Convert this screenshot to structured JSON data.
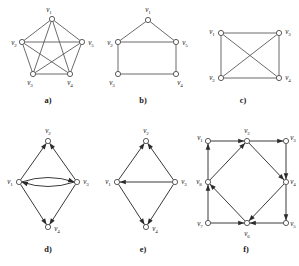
{
  "figure": {
    "background_color": "#ffffff",
    "edge_color": "#5a5a5a",
    "node_fill": "#ffffff",
    "node_stroke": "#4a4a4a",
    "label_color": "#1a1a1a",
    "width": 299,
    "height": 266
  },
  "panels": [
    {
      "id": "a",
      "caption": "a)",
      "caption_x": 48,
      "caption_y": 103,
      "kind": "undirected",
      "description": "complete graph K5 drawn as pentagon with all diagonals",
      "nodes": [
        {
          "name": "v1",
          "label": "v",
          "sub": "1",
          "x": 52,
          "y": 19,
          "lx": 49,
          "ly": 12,
          "anchor": "middle"
        },
        {
          "name": "v2",
          "label": "v",
          "sub": "2",
          "x": 22,
          "y": 42,
          "lx": 14,
          "ly": 45,
          "anchor": "middle"
        },
        {
          "name": "v5",
          "label": "v",
          "sub": "5",
          "x": 82,
          "y": 42,
          "lx": 91,
          "ly": 45,
          "anchor": "middle"
        },
        {
          "name": "v3",
          "label": "v",
          "sub": "3",
          "x": 33,
          "y": 74,
          "lx": 30,
          "ly": 85,
          "anchor": "middle"
        },
        {
          "name": "v4",
          "label": "v",
          "sub": "4",
          "x": 70,
          "y": 74,
          "lx": 70,
          "ly": 85,
          "anchor": "middle"
        }
      ],
      "edges": [
        {
          "from": "v1",
          "to": "v2"
        },
        {
          "from": "v1",
          "to": "v5"
        },
        {
          "from": "v1",
          "to": "v3"
        },
        {
          "from": "v1",
          "to": "v4"
        },
        {
          "from": "v2",
          "to": "v5"
        },
        {
          "from": "v2",
          "to": "v3"
        },
        {
          "from": "v2",
          "to": "v4"
        },
        {
          "from": "v5",
          "to": "v3"
        },
        {
          "from": "v5",
          "to": "v4"
        },
        {
          "from": "v3",
          "to": "v4"
        }
      ]
    },
    {
      "id": "b",
      "caption": "b)",
      "caption_x": 143,
      "caption_y": 103,
      "kind": "undirected",
      "description": "house graph: triangle roof over square",
      "nodes": [
        {
          "name": "v1",
          "label": "v",
          "sub": "1",
          "x": 148,
          "y": 20,
          "lx": 148,
          "ly": 12,
          "anchor": "middle"
        },
        {
          "name": "v2",
          "label": "v",
          "sub": "2",
          "x": 118,
          "y": 42,
          "lx": 110,
          "ly": 45,
          "anchor": "middle"
        },
        {
          "name": "v5",
          "label": "v",
          "sub": "5",
          "x": 176,
          "y": 42,
          "lx": 185,
          "ly": 45,
          "anchor": "middle"
        },
        {
          "name": "v3",
          "label": "v",
          "sub": "3",
          "x": 118,
          "y": 74,
          "lx": 112,
          "ly": 85,
          "anchor": "middle"
        },
        {
          "name": "v4",
          "label": "v",
          "sub": "4",
          "x": 176,
          "y": 74,
          "lx": 180,
          "ly": 85,
          "anchor": "middle"
        }
      ],
      "edges": [
        {
          "from": "v1",
          "to": "v2"
        },
        {
          "from": "v1",
          "to": "v5"
        },
        {
          "from": "v2",
          "to": "v5"
        },
        {
          "from": "v2",
          "to": "v3"
        },
        {
          "from": "v5",
          "to": "v4"
        },
        {
          "from": "v3",
          "to": "v4"
        }
      ]
    },
    {
      "id": "c",
      "caption": "c)",
      "caption_x": 243,
      "caption_y": 103,
      "kind": "undirected",
      "description": "complete graph K4 drawn as rectangle with both diagonals",
      "nodes": [
        {
          "name": "v1",
          "label": "v",
          "sub": "1",
          "x": 221,
          "y": 33,
          "lx": 212,
          "ly": 34,
          "anchor": "middle"
        },
        {
          "name": "v3",
          "label": "v",
          "sub": "3",
          "x": 279,
          "y": 33,
          "lx": 288,
          "ly": 34,
          "anchor": "middle"
        },
        {
          "name": "v2",
          "label": "v",
          "sub": "2",
          "x": 221,
          "y": 78,
          "lx": 212,
          "ly": 80,
          "anchor": "middle"
        },
        {
          "name": "v4",
          "label": "v",
          "sub": "4",
          "x": 279,
          "y": 78,
          "lx": 288,
          "ly": 80,
          "anchor": "middle"
        }
      ],
      "edges": [
        {
          "from": "v1",
          "to": "v3"
        },
        {
          "from": "v1",
          "to": "v2"
        },
        {
          "from": "v3",
          "to": "v4"
        },
        {
          "from": "v2",
          "to": "v4"
        },
        {
          "from": "v1",
          "to": "v4"
        },
        {
          "from": "v2",
          "to": "v3"
        }
      ]
    },
    {
      "id": "d",
      "caption": "d)",
      "caption_x": 48,
      "caption_y": 252,
      "kind": "directed-multigraph",
      "description": "diamond digraph with a pair of opposite curved arcs between v1 and v3",
      "nodes": [
        {
          "name": "v2",
          "label": "v",
          "sub": "2",
          "x": 48,
          "y": 141,
          "lx": 48,
          "ly": 133,
          "anchor": "middle"
        },
        {
          "name": "v1",
          "label": "v",
          "sub": "1",
          "x": 19,
          "y": 182,
          "lx": 10,
          "ly": 184,
          "anchor": "middle"
        },
        {
          "name": "v3",
          "label": "v",
          "sub": "3",
          "x": 77,
          "y": 182,
          "lx": 86,
          "ly": 184,
          "anchor": "middle"
        },
        {
          "name": "v4",
          "label": "v",
          "sub": "4",
          "x": 48,
          "y": 227,
          "lx": 57,
          "ly": 231,
          "anchor": "middle"
        }
      ],
      "edges": [
        {
          "from": "v1",
          "to": "v2",
          "directed": true
        },
        {
          "from": "v3",
          "to": "v2",
          "directed": true
        },
        {
          "from": "v1",
          "to": "v3",
          "directed": true,
          "curve": "up"
        },
        {
          "from": "v3",
          "to": "v1",
          "directed": true,
          "curve": "down"
        },
        {
          "from": "v1",
          "to": "v4",
          "directed": true
        },
        {
          "from": "v3",
          "to": "v4",
          "directed": true
        }
      ]
    },
    {
      "id": "e",
      "caption": "e)",
      "caption_x": 143,
      "caption_y": 252,
      "kind": "directed",
      "description": "diamond digraph with a single straight arc from v3 to v1",
      "nodes": [
        {
          "name": "v2",
          "label": "v",
          "sub": "2",
          "x": 146,
          "y": 141,
          "lx": 146,
          "ly": 133,
          "anchor": "middle"
        },
        {
          "name": "v1",
          "label": "v",
          "sub": "1",
          "x": 117,
          "y": 182,
          "lx": 108,
          "ly": 184,
          "anchor": "middle"
        },
        {
          "name": "v3",
          "label": "v",
          "sub": "3",
          "x": 175,
          "y": 182,
          "lx": 184,
          "ly": 184,
          "anchor": "middle"
        },
        {
          "name": "v4",
          "label": "v",
          "sub": "4",
          "x": 146,
          "y": 227,
          "lx": 155,
          "ly": 231,
          "anchor": "middle"
        }
      ],
      "edges": [
        {
          "from": "v1",
          "to": "v2",
          "directed": true
        },
        {
          "from": "v3",
          "to": "v2",
          "directed": true
        },
        {
          "from": "v3",
          "to": "v1",
          "directed": true
        },
        {
          "from": "v1",
          "to": "v4",
          "directed": true
        },
        {
          "from": "v3",
          "to": "v4",
          "directed": true
        }
      ]
    },
    {
      "id": "f",
      "caption": "f)",
      "caption_x": 246,
      "caption_y": 252,
      "kind": "directed",
      "description": "eight-vertex digraph: outer square with inscribed rotated square",
      "nodes": [
        {
          "name": "v1",
          "label": "v",
          "sub": "1",
          "x": 208,
          "y": 141,
          "lx": 200,
          "ly": 140,
          "anchor": "middle"
        },
        {
          "name": "v2",
          "label": "v",
          "sub": "2",
          "x": 247,
          "y": 141,
          "lx": 247,
          "ly": 133,
          "anchor": "middle"
        },
        {
          "name": "v3",
          "label": "v",
          "sub": "3",
          "x": 286,
          "y": 141,
          "lx": 293,
          "ly": 140,
          "anchor": "middle"
        },
        {
          "name": "v4",
          "label": "v",
          "sub": "4",
          "x": 286,
          "y": 182,
          "lx": 293,
          "ly": 184,
          "anchor": "middle"
        },
        {
          "name": "v5",
          "label": "v",
          "sub": "5",
          "x": 286,
          "y": 223,
          "lx": 293,
          "ly": 226,
          "anchor": "middle"
        },
        {
          "name": "v6",
          "label": "v",
          "sub": "6",
          "x": 247,
          "y": 223,
          "lx": 247,
          "ly": 236,
          "anchor": "middle"
        },
        {
          "name": "v7",
          "label": "v",
          "sub": "7",
          "x": 208,
          "y": 223,
          "lx": 200,
          "ly": 226,
          "anchor": "middle"
        },
        {
          "name": "v8",
          "label": "v",
          "sub": "8",
          "x": 208,
          "y": 182,
          "lx": 199,
          "ly": 184,
          "anchor": "middle"
        }
      ],
      "edges": [
        {
          "from": "v1",
          "to": "v2",
          "directed": true
        },
        {
          "from": "v2",
          "to": "v3",
          "directed": true
        },
        {
          "from": "v3",
          "to": "v4",
          "directed": true
        },
        {
          "from": "v4",
          "to": "v5",
          "directed": true
        },
        {
          "from": "v5",
          "to": "v6",
          "directed": true
        },
        {
          "from": "v7",
          "to": "v6",
          "directed": true
        },
        {
          "from": "v7",
          "to": "v8",
          "directed": true
        },
        {
          "from": "v8",
          "to": "v1",
          "directed": true
        },
        {
          "from": "v8",
          "to": "v2",
          "directed": true
        },
        {
          "from": "v2",
          "to": "v4",
          "directed": true
        },
        {
          "from": "v4",
          "to": "v6",
          "directed": true
        },
        {
          "from": "v6",
          "to": "v8",
          "directed": true
        }
      ]
    }
  ]
}
